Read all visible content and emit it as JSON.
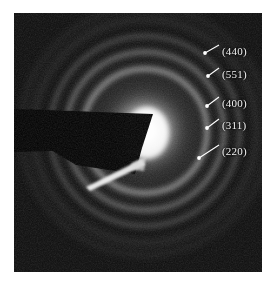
{
  "figure": {
    "type": "selected-area-electron-diffraction-pattern",
    "caption": "",
    "panel": {
      "x": 14,
      "y": 13,
      "width": 248,
      "height": 259,
      "background_color": "#0b0b0b",
      "border_color": "#cfcfcf"
    },
    "page_background": "#ffffff"
  },
  "pattern": {
    "center": {
      "x": 145,
      "y": 131
    },
    "halo": {
      "description": "bright diffuse central transmitted-beam halo",
      "color": "#ffffff",
      "radius": 44
    },
    "rings": [
      {
        "label": "(220)",
        "radius": 62,
        "brightness": 0.55,
        "color": "#9a9a9a"
      },
      {
        "label": "(311)",
        "radius": 79,
        "brightness": 0.42,
        "color": "#858585"
      },
      {
        "label": "(400)",
        "radius": 95,
        "brightness": 0.26,
        "color": "#6a6a6a"
      },
      {
        "label": "(551)",
        "radius": 112,
        "brightness": 0.16,
        "color": "#555555"
      },
      {
        "label": "(440)",
        "radius": 124,
        "brightness": 0.12,
        "color": "#4a4a4a"
      }
    ],
    "beam_stopper": {
      "description": "dark tapered beam-stop wedge entering from upper left",
      "color": "#000000"
    },
    "beam_stopper_streak": {
      "description": "bright thin streak below the beam stop",
      "color": "#f0f0f0"
    }
  },
  "annotations": {
    "marker_color": "#ffffff",
    "leader_color": "#ffffff",
    "text_color": "#f2f2f2",
    "items": [
      {
        "label": "(440)",
        "text_x": 222,
        "text_y": 40,
        "leader_x1": 219,
        "leader_y1": 45,
        "leader_x2": 205,
        "leader_y2": 53,
        "dot_x": 205,
        "dot_y": 53
      },
      {
        "label": "(551)",
        "text_x": 222,
        "text_y": 64,
        "leader_x1": 219,
        "leader_y1": 68,
        "leader_x2": 208,
        "leader_y2": 76,
        "dot_x": 208,
        "dot_y": 76
      },
      {
        "label": "(400)",
        "text_x": 222,
        "text_y": 92,
        "leader_x1": 219,
        "leader_y1": 97,
        "leader_x2": 207,
        "leader_y2": 106,
        "dot_x": 207,
        "dot_y": 106
      },
      {
        "label": "(311)",
        "text_x": 222,
        "text_y": 115,
        "leader_x1": 219,
        "leader_y1": 119,
        "leader_x2": 207,
        "leader_y2": 128,
        "dot_x": 207,
        "dot_y": 128
      },
      {
        "label": "(220)",
        "text_x": 222,
        "text_y": 140,
        "leader_x1": 219,
        "leader_y1": 145,
        "leader_x2": 199,
        "leader_y2": 158,
        "dot_x": 199,
        "dot_y": 158
      }
    ]
  }
}
